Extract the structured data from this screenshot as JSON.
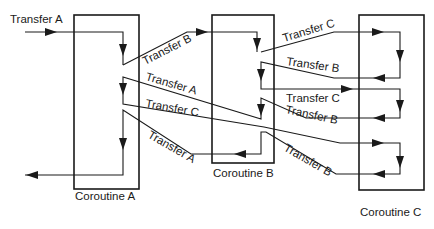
{
  "diagram": {
    "coroutines": [
      {
        "id": "A",
        "label": "Coroutine A"
      },
      {
        "id": "B",
        "label": "Coroutine B"
      },
      {
        "id": "C",
        "label": "Coroutine C"
      }
    ],
    "entry_label": "Transfer A",
    "transfers": [
      {
        "from": "A",
        "to": "B",
        "label": "Transfer B"
      },
      {
        "from": "B",
        "to": "C",
        "label": "Transfer C"
      },
      {
        "from": "C",
        "to": "B",
        "label": "Transfer B"
      },
      {
        "from": "B",
        "to": "A",
        "label": "Transfer A"
      },
      {
        "from": "B",
        "to": "C",
        "label": "Transfer C"
      },
      {
        "from": "C",
        "to": "B",
        "label": "Transfer B"
      },
      {
        "from": "A",
        "to": "C",
        "label": "Transfer C"
      },
      {
        "from": "C",
        "to": "B",
        "label": "Transfer B"
      },
      {
        "from": "B",
        "to": "A",
        "label": "Transfer A"
      }
    ]
  }
}
